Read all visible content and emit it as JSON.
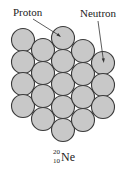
{
  "figure": {
    "labels": {
      "proton": "Proton",
      "neutron": "Neutron"
    },
    "isotope": {
      "mass_number": "20",
      "atomic_number": "10",
      "symbol": "Ne"
    },
    "colors": {
      "nucleon_fill": "#c8c8c8",
      "nucleon_stroke": "#3a3a3a",
      "line": "#333333"
    },
    "nucleons": [
      {
        "x": 23,
        "y": 40
      },
      {
        "x": 23,
        "y": 62
      },
      {
        "x": 23,
        "y": 84
      },
      {
        "x": 23,
        "y": 106
      },
      {
        "x": 43,
        "y": 50
      },
      {
        "x": 43,
        "y": 73
      },
      {
        "x": 43,
        "y": 96
      },
      {
        "x": 43,
        "y": 119
      },
      {
        "x": 63,
        "y": 38
      },
      {
        "x": 63,
        "y": 61
      },
      {
        "x": 63,
        "y": 84
      },
      {
        "x": 63,
        "y": 107
      },
      {
        "x": 63,
        "y": 130
      },
      {
        "x": 83,
        "y": 51
      },
      {
        "x": 83,
        "y": 74
      },
      {
        "x": 83,
        "y": 97
      },
      {
        "x": 83,
        "y": 120
      },
      {
        "x": 103,
        "y": 63
      },
      {
        "x": 103,
        "y": 85
      },
      {
        "x": 103,
        "y": 107
      }
    ],
    "nucleon_radius": 11.5
  }
}
